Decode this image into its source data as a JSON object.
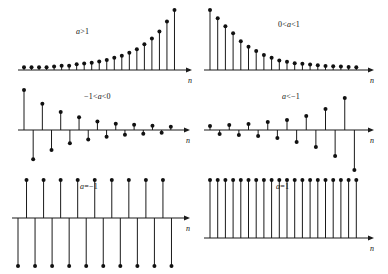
{
  "figure": {
    "axis_label": "n",
    "stem_color": "#1a1a1a",
    "axis_color": "#1a1a1a",
    "background": "#ffffff"
  },
  "panels": [
    {
      "id": "panel-a-gt-1",
      "label": "a>1",
      "label_parts": {
        "a": "a",
        "rest": ">1"
      },
      "description": "growing exponential, all positive",
      "x": 8,
      "y": 6,
      "w": 186,
      "h": 78,
      "label_x": 68,
      "label_y": 21,
      "axis_y": 64,
      "axis_x0": 10,
      "axis_x1": 178,
      "n_label_x": 180,
      "n_label_y": 70,
      "chart_data": {
        "type": "stem",
        "xlabel": "n",
        "values": [
          2,
          2,
          2,
          2,
          2.5,
          3,
          3,
          4,
          4.5,
          5,
          6,
          7,
          8.5,
          10,
          12,
          14.5,
          18,
          22,
          27,
          34,
          42
        ]
      }
    },
    {
      "id": "panel-0-lt-a-lt-1",
      "label": "0<a<1",
      "label_parts": {
        "pre": "0<",
        "a": "a",
        "rest": "<1"
      },
      "description": "decaying exponential, all positive",
      "x": 196,
      "y": 6,
      "w": 186,
      "h": 78,
      "label_x": 82,
      "label_y": 14,
      "axis_y": 64,
      "axis_x0": 8,
      "axis_x1": 172,
      "n_label_x": 174,
      "n_label_y": 70,
      "chart_data": {
        "type": "stem",
        "xlabel": "n",
        "values": [
          44,
          38,
          32,
          27,
          21,
          17,
          14,
          11,
          9,
          7,
          6,
          5,
          4.5,
          4,
          3.5,
          3,
          2.8,
          2.5,
          2.2,
          2
        ]
      }
    },
    {
      "id": "panel-neg1-lt-a-lt-0",
      "label": "-1<a<0",
      "label_parts": {
        "pre": "−1<",
        "a": "a",
        "rest": "<0"
      },
      "description": "decaying exponential with alternating sign",
      "x": 8,
      "y": 86,
      "w": 186,
      "h": 84,
      "label_x": 76,
      "label_y": 6,
      "axis_y": 44,
      "axis_x0": 10,
      "axis_x1": 176,
      "n_label_x": 178,
      "n_label_y": 50,
      "chart_data": {
        "type": "stem",
        "xlabel": "n",
        "values": [
          38,
          -31,
          25,
          -21,
          17,
          -14,
          12,
          -10,
          8,
          -7,
          6,
          -5,
          5,
          -4,
          4,
          -3,
          3
        ]
      }
    },
    {
      "id": "panel-a-lt-neg1",
      "label": "a<-1",
      "label_parts": {
        "a": "a",
        "rest": "<−1"
      },
      "description": "growing exponential with alternating sign",
      "x": 196,
      "y": 86,
      "w": 186,
      "h": 88,
      "label_x": 86,
      "label_y": 6,
      "axis_y": 44,
      "axis_x0": 8,
      "axis_x1": 172,
      "n_label_x": 174,
      "n_label_y": 50,
      "chart_data": {
        "type": "stem",
        "xlabel": "n",
        "values": [
          4,
          -4,
          5,
          -5,
          6,
          -6,
          8,
          -8,
          10,
          -12,
          14,
          -17,
          21,
          -26,
          32,
          -40
        ]
      }
    },
    {
      "id": "panel-a-eq-neg1",
      "label": "a=-1",
      "label_parts": {
        "a": "a",
        "rest": "=−1"
      },
      "description": "constant amplitude alternating sign",
      "x": 8,
      "y": 176,
      "w": 186,
      "h": 94,
      "label_x": 72,
      "label_y": 6,
      "axis_y": 42,
      "axis_x0": 4,
      "axis_x1": 176,
      "n_label_x": 178,
      "n_label_y": 48,
      "chart_data": {
        "type": "stem",
        "xlabel": "n",
        "values": [
          -30,
          30,
          -30,
          30,
          -30,
          30,
          -30,
          30,
          -30,
          30,
          -30,
          30,
          -30,
          30,
          -30,
          30,
          -30,
          30,
          -30
        ]
      }
    },
    {
      "id": "panel-a-eq-1",
      "label": "a=1",
      "label_parts": {
        "a": "a",
        "rest": "=1"
      },
      "description": "constant positive unit sequence",
      "x": 196,
      "y": 176,
      "w": 186,
      "h": 94,
      "label_x": 80,
      "label_y": 6,
      "axis_y": 62,
      "axis_x0": 8,
      "axis_x1": 172,
      "n_label_x": 174,
      "n_label_y": 68,
      "chart_data": {
        "type": "stem",
        "xlabel": "n",
        "values": [
          30,
          30,
          30,
          30,
          30,
          30,
          30,
          30,
          30,
          30,
          30,
          30,
          30,
          30,
          30,
          30,
          30,
          30,
          30,
          30
        ]
      }
    }
  ],
  "chart_data": [
    {
      "type": "stem",
      "title": "a>1",
      "xlabel": "n",
      "ylabel": "",
      "categories": [
        0,
        1,
        2,
        3,
        4,
        5,
        6,
        7,
        8,
        9,
        10,
        11,
        12,
        13,
        14,
        15,
        16,
        17,
        18,
        19,
        20
      ],
      "values": [
        2,
        2,
        2,
        2,
        2.5,
        3,
        3,
        4,
        4.5,
        5,
        6,
        7,
        8.5,
        10,
        12,
        14.5,
        18,
        22,
        27,
        34,
        42
      ],
      "legend": [],
      "grid": false
    },
    {
      "type": "stem",
      "title": "0<a<1",
      "xlabel": "n",
      "ylabel": "",
      "categories": [
        0,
        1,
        2,
        3,
        4,
        5,
        6,
        7,
        8,
        9,
        10,
        11,
        12,
        13,
        14,
        15,
        16,
        17,
        18,
        19
      ],
      "values": [
        44,
        38,
        32,
        27,
        21,
        17,
        14,
        11,
        9,
        7,
        6,
        5,
        4.5,
        4,
        3.5,
        3,
        2.8,
        2.5,
        2.2,
        2
      ],
      "legend": [],
      "grid": false
    },
    {
      "type": "stem",
      "title": "-1<a<0",
      "xlabel": "n",
      "ylabel": "",
      "categories": [
        0,
        1,
        2,
        3,
        4,
        5,
        6,
        7,
        8,
        9,
        10,
        11,
        12,
        13,
        14,
        15,
        16
      ],
      "values": [
        38,
        -31,
        25,
        -21,
        17,
        -14,
        12,
        -10,
        8,
        -7,
        6,
        -5,
        5,
        -4,
        4,
        -3,
        3
      ],
      "legend": [],
      "grid": false
    },
    {
      "type": "stem",
      "title": "a<-1",
      "xlabel": "n",
      "ylabel": "",
      "categories": [
        0,
        1,
        2,
        3,
        4,
        5,
        6,
        7,
        8,
        9,
        10,
        11,
        12,
        13,
        14,
        15
      ],
      "values": [
        4,
        -4,
        5,
        -5,
        6,
        -6,
        8,
        -8,
        10,
        -12,
        14,
        -17,
        21,
        -26,
        32,
        -40
      ],
      "legend": [],
      "grid": false
    },
    {
      "type": "stem",
      "title": "a=-1",
      "xlabel": "n",
      "ylabel": "",
      "categories": [
        0,
        1,
        2,
        3,
        4,
        5,
        6,
        7,
        8,
        9,
        10,
        11,
        12,
        13,
        14,
        15,
        16,
        17,
        18
      ],
      "values": [
        -30,
        30,
        -30,
        30,
        -30,
        30,
        -30,
        30,
        -30,
        30,
        -30,
        30,
        -30,
        30,
        -30,
        30,
        -30,
        30,
        -30
      ],
      "legend": [],
      "grid": false
    },
    {
      "type": "stem",
      "title": "a=1",
      "xlabel": "n",
      "ylabel": "",
      "categories": [
        0,
        1,
        2,
        3,
        4,
        5,
        6,
        7,
        8,
        9,
        10,
        11,
        12,
        13,
        14,
        15,
        16,
        17,
        18,
        19
      ],
      "values": [
        30,
        30,
        30,
        30,
        30,
        30,
        30,
        30,
        30,
        30,
        30,
        30,
        30,
        30,
        30,
        30,
        30,
        30,
        30,
        30
      ],
      "legend": [],
      "grid": false
    }
  ]
}
